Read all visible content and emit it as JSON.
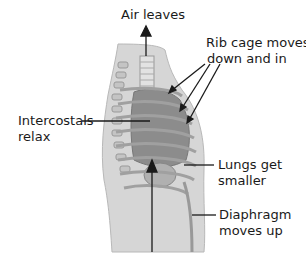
{
  "diagram": {
    "labels": {
      "air": "Air leaves",
      "rib_line1": "Rib cage moves",
      "rib_line2": "down and in",
      "intercostals_line1": "Intercostals",
      "intercostals_line2": "relax",
      "lungs_line1": "Lungs get",
      "lungs_line2": "smaller",
      "diaphragm_line1": "Diaphragm",
      "diaphragm_line2": "moves up"
    },
    "colors": {
      "body": "#d4d4d4",
      "ribs": "#a8a8a8",
      "lungs": "#8c8c8c",
      "lines": "#1a1a1a"
    }
  }
}
